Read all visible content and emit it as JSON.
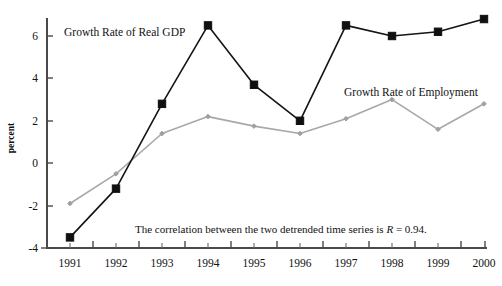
{
  "chart_data": {
    "type": "line",
    "title": "",
    "xlabel": "",
    "ylabel": "percent",
    "categories": [
      "1991",
      "1992",
      "1993",
      "1994",
      "1995",
      "1996",
      "1997",
      "1998",
      "1999",
      "2000"
    ],
    "x": [
      1991,
      1992,
      1993,
      1994,
      1995,
      1996,
      1997,
      1998,
      1999,
      2000
    ],
    "xlim": [
      1990.6,
      2000.6
    ],
    "ylim": [
      -4,
      7.2
    ],
    "yticks": [
      -4,
      -2,
      0,
      2,
      4,
      6
    ],
    "ytick_labels": [
      "-4",
      "-2",
      "0",
      "2",
      "4",
      "6"
    ],
    "grid": false,
    "legend_position": "inline-annotations",
    "series": [
      {
        "name": "Growth Rate of Real GDP",
        "color": "#101010",
        "marker": "square",
        "values": [
          -3.5,
          -1.2,
          2.8,
          6.5,
          3.7,
          2.0,
          6.5,
          6.0,
          6.2,
          6.8
        ]
      },
      {
        "name": "Growth Rate of Employment",
        "color": "#a0a0a0",
        "marker": "diamond",
        "values": [
          -1.9,
          -0.5,
          1.4,
          2.2,
          1.75,
          1.4,
          2.1,
          3.0,
          1.6,
          2.8
        ]
      }
    ],
    "annotations": [
      {
        "name": "correlation-note",
        "text_before": "The correlation between the two detrended time series is ",
        "text_italic": "R",
        "text_after": " = 0.94.",
        "full_text": "The correlation between the two detrended time series is R = 0.94."
      }
    ]
  },
  "labels": {
    "y_axis_title": "percent",
    "series_gdp_label": "Growth Rate of Real GDP",
    "series_emp_label": "Growth Rate of Employment",
    "ytick_6": "6",
    "ytick_4": "4",
    "ytick_2": "2",
    "ytick_0": "0",
    "ytick_m2": "-2",
    "ytick_m4": "-4",
    "xtick_1991": "1991",
    "xtick_1992": "1992",
    "xtick_1993": "1993",
    "xtick_1994": "1994",
    "xtick_1995": "1995",
    "xtick_1996": "1996",
    "xtick_1997": "1997",
    "xtick_1998": "1998",
    "xtick_1999": "1999",
    "xtick_2000": "2000",
    "annotation_before": "The correlation between the two detrended time series is ",
    "annotation_italic": "R",
    "annotation_after": " = 0.94."
  },
  "colors": {
    "gdp_series": "#101010",
    "employment_series": "#a0a0a0",
    "axis": "#4a4a4a",
    "background": "#ffffff"
  }
}
